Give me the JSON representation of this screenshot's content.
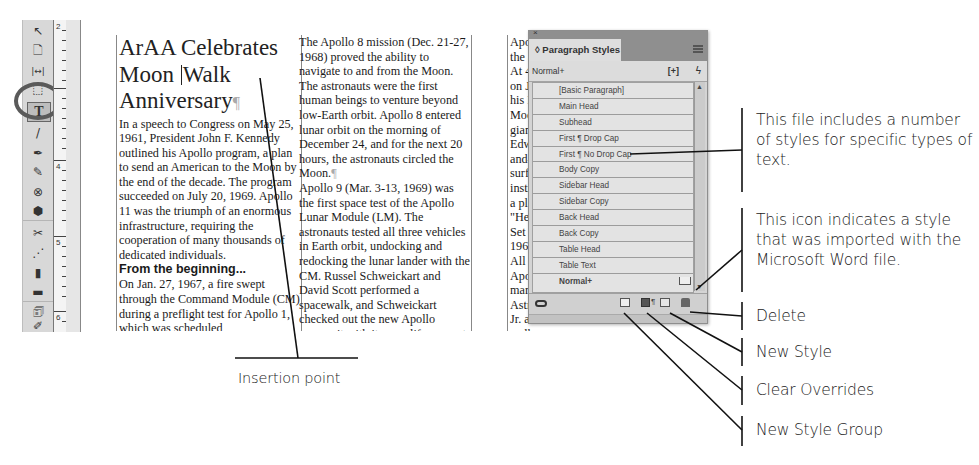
{
  "toolbar": {
    "tools": [
      {
        "name": "selection-tool",
        "glyph": "↖"
      },
      {
        "name": "page-tool",
        "glyph": "🗋"
      },
      {
        "name": "gap-tool",
        "glyph": "|↔|"
      },
      {
        "name": "content-collector-tool",
        "glyph": "⬚"
      },
      {
        "name": "type-tool",
        "glyph": "T"
      },
      {
        "name": "line-tool",
        "glyph": "/"
      },
      {
        "name": "pen-tool",
        "glyph": "✒"
      },
      {
        "name": "pencil-tool",
        "glyph": "✎"
      },
      {
        "name": "rectangle-frame-tool",
        "glyph": "⊗"
      },
      {
        "name": "polygon-tool",
        "glyph": "⬢"
      },
      {
        "name": "scissors-tool",
        "glyph": "✂"
      },
      {
        "name": "free-transform-tool",
        "glyph": "⋰"
      },
      {
        "name": "gradient-swatch-tool",
        "glyph": "▮"
      },
      {
        "name": "gradient-feather-tool",
        "glyph": "▬"
      },
      {
        "name": "note-tool",
        "glyph": "🗊"
      },
      {
        "name": "eyedropper-tool",
        "glyph": "✐"
      },
      {
        "name": "hand-tool",
        "glyph": "✋"
      }
    ]
  },
  "ruler": {
    "labels": [
      "2",
      "4",
      "5",
      "6"
    ]
  },
  "document": {
    "headline_line1": "ArAA Celebrates",
    "headline_line2a": "Moon",
    "headline_line2b": "Walk",
    "headline_line3": "Anniversary",
    "pilcrow": "¶",
    "column1_body": "In a speech to Congress on May 25, 1961, President John F. Kennedy outlined his Apollo program, a plan to send an American to the Moon by the end of the decade. The program succeeded on July 20, 1969. Apollo 11 was the triumph of an enormous infrastructure, requiring the cooperation of many thousands of dedicated individuals.",
    "column1_subhead": "From the beginning...",
    "column1_body2": "On Jan. 27, 1967, a fire swept through the Command Module (CM) during a preflight test for Apollo 1, which was scheduled",
    "column2_body": "The Apollo 8 mission (Dec. 21-27, 1968) proved the ability to navigate to and from the Moon. The astronauts were the first human beings to venture beyond low-Earth orbit. Apollo 8 entered lunar orbit on the morning of December 24, and for the next 20 hours, the astronauts circled the Moon.",
    "column2_body2": "Apollo 9 (Mar. 3-13, 1969) was the first space test of the Apollo Lunar Module (LM). The astronauts tested all three vehicles in Earth orbit, undocking and redocking the lunar lander with the CM. Russel Schweickart and David Scott performed a spacewalk, and Schweickart checked out the new Apollo spacesuit with its own life support system.",
    "column2_body3": "Apollo 10 (May 18-26, 1969) was",
    "column3_lines": [
      "Apollo 11",
      "the achiev",
      "At 4:17 p.m",
      "on July 20,",
      "his LM to",
      "Moon. Six",
      "giant leap",
      "Edwin \"Bu",
      "and-a-half",
      "surface. Th",
      "instrumnet",
      "a plaque b",
      "\"Here Men",
      "Set Foot U",
      "1969 A.D.",
      "All Mankin",
      "Apollo 12",
      "marked the",
      "Astronauts",
      "Jr. and Ala",
      "walks, collecting rocks and setting"
    ]
  },
  "panel": {
    "close_glyph": "×",
    "tab_label": "◊ Paragraph Styles",
    "current_style": "Normal+",
    "new_group_glyph": "[+]",
    "lightning_glyph": "ϟ",
    "styles": [
      "[Basic Paragraph]",
      "Main Head",
      "Subhead",
      "First ¶ Drop Cap",
      "First ¶ No Drop Cap",
      "Body Copy",
      "Sidebar Head",
      "Sidebar Copy",
      "Back Head",
      "Back Copy",
      "Table Head",
      "Table Text",
      "Normal+"
    ],
    "scroll_up_glyph": "▲",
    "scroll_down_glyph": "▼",
    "clear_overrides_mark": "¶"
  },
  "callouts": {
    "styles_note": "This file includes a number of styles for specific types of text.",
    "import_note": "This icon indicates a style that was imported with the Microsoft Word file.",
    "delete": "Delete",
    "new_style": "New Style",
    "clear_overrides": "Clear Overrides",
    "new_style_group": "New Style Group",
    "insertion_point": "Insertion point"
  }
}
